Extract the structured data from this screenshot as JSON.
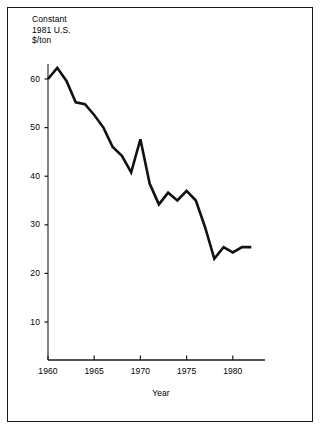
{
  "figure": {
    "border_color": "#1a1a1a",
    "background": "#ffffff",
    "line_color": "#111111"
  },
  "chart_data": {
    "type": "line",
    "title": "",
    "ylabel": "Constant\n1981 U.S.\n$/ton",
    "ylabel_lines": [
      "Constant",
      "1981 U.S.",
      "$/ton"
    ],
    "xlabel": "Year",
    "xlim": [
      1960,
      1982
    ],
    "ylim": [
      0,
      66
    ],
    "grid": false,
    "legend": null,
    "yticks": [
      10,
      20,
      30,
      40,
      50,
      60
    ],
    "ytick_labels": [
      "10",
      "20",
      "30",
      "40",
      "50",
      "60"
    ],
    "xticks": [
      1960,
      1965,
      1970,
      1975,
      1980
    ],
    "xtick_labels": [
      "1960",
      "1965",
      "1970",
      "1975",
      "1980"
    ],
    "x": [
      1960,
      1961,
      1962,
      1963,
      1964,
      1965,
      1966,
      1967,
      1968,
      1969,
      1970,
      1971,
      1972,
      1973,
      1974,
      1975,
      1976,
      1977,
      1978,
      1979,
      1980,
      1981,
      1982
    ],
    "values": [
      60.0,
      62.3,
      59.6,
      55.2,
      54.8,
      52.6,
      50.0,
      46.0,
      44.2,
      40.8,
      47.6,
      38.5,
      34.2,
      36.6,
      35.0,
      37.0,
      35.0,
      29.5,
      23.0,
      25.4,
      24.3,
      25.4,
      25.4
    ],
    "series": [
      {
        "name": "Constant 1981 U.S. $/ton",
        "values": [
          60.0,
          62.3,
          59.6,
          55.2,
          54.8,
          52.6,
          50.0,
          46.0,
          44.2,
          40.8,
          47.6,
          38.5,
          34.2,
          36.6,
          35.0,
          37.0,
          35.0,
          29.5,
          23.0,
          25.4,
          24.3,
          25.4,
          25.4
        ]
      }
    ]
  }
}
